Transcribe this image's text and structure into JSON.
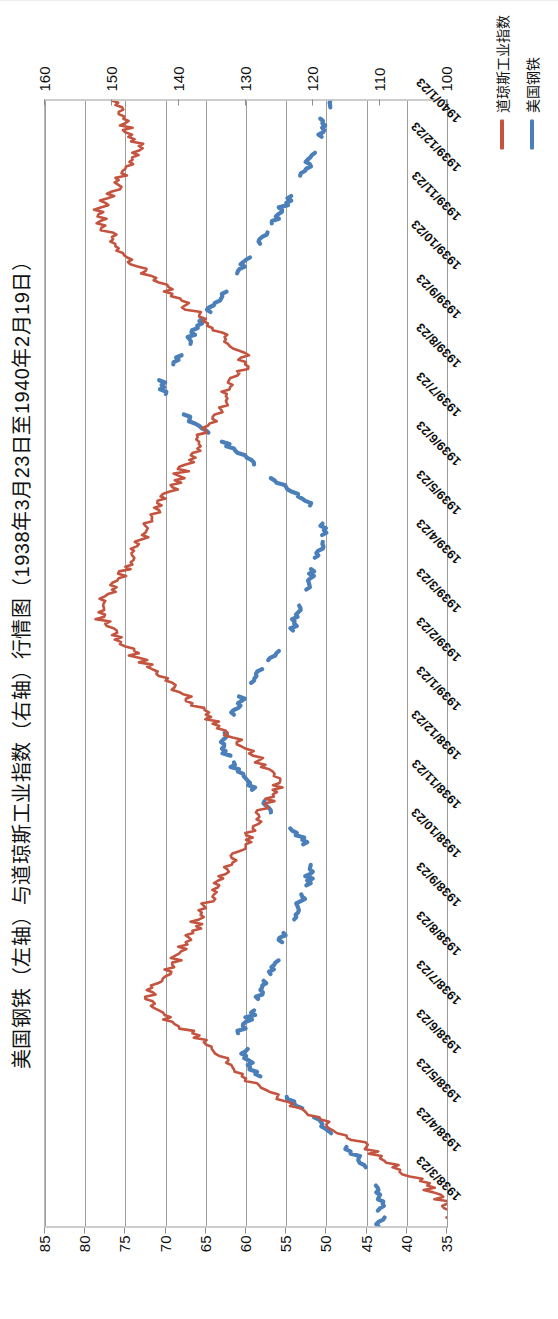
{
  "chart_data": {
    "type": "line",
    "title": "美国钢铁（左轴）与道琼斯工业指数（右轴）行情图（1938年3月23日至1940年2月19日）",
    "xlabel": "",
    "ylabel_left": "美国钢铁",
    "ylabel_right": "道琼斯工业指数",
    "grid": true,
    "legend_position": "bottom-right",
    "axis_left": {
      "name": "美国钢铁（左轴）",
      "ticks": [
        85,
        80,
        75,
        70,
        65,
        60,
        55,
        50,
        45,
        40,
        35
      ],
      "min": 35,
      "max": 85
    },
    "axis_right": {
      "name": "道琼斯工业指数（右轴）",
      "ticks": [
        160,
        150,
        140,
        130,
        120,
        110,
        100
      ],
      "min": 100,
      "max": 160
    },
    "x_tick_labels": [
      "1938/3/23",
      "1938/4/23",
      "1938/5/23",
      "1938/6/23",
      "1938/7/23",
      "1938/8/23",
      "1938/9/23",
      "1938/10/23",
      "1938/11/23",
      "1938/12/23",
      "1939/1/23",
      "1939/2/23",
      "1939/3/23",
      "1939/4/23",
      "1939/5/23",
      "1939/6/23",
      "1939/7/23",
      "1939/8/23",
      "1939/9/23",
      "1939/10/23",
      "1939/11/23",
      "1939/12/23",
      "1940/1/23"
    ],
    "series": [
      {
        "name": "美国钢铁",
        "color": "#4b7fba",
        "axis": "left",
        "note": "蓝色线（左轴，美国钢铁股价，单位美元）",
        "values": [
          43.5,
          43.2,
          43.0,
          43.8,
          44.5,
          45.0,
          46.0,
          47.5,
          49.0,
          50.5,
          52.0,
          54.0,
          56.0,
          58.0,
          59.5,
          60.0,
          60.5,
          61.0,
          60.0,
          59.0,
          58.5,
          58.0,
          57.0,
          56.5,
          56.0,
          55.5,
          55.0,
          54.0,
          53.5,
          53.0,
          52.5,
          52.0,
          51.5,
          52.0,
          53.0,
          54.5,
          56.0,
          57.5,
          58.5,
          59.5,
          61.0,
          62.0,
          63.0,
          62.5,
          62.0,
          61.5,
          61.0,
          60.0,
          59.0,
          58.0,
          57.0,
          56.0,
          55.0,
          54.0,
          53.5,
          53.0,
          52.5,
          52.0,
          51.5,
          51.0,
          50.5,
          50.0,
          50.5,
          51.5,
          53.0,
          55.0,
          57.0,
          59.0,
          61.0,
          63.0,
          65.0,
          67.0,
          69.0,
          70.0,
          70.5,
          70.0,
          69.0,
          68.0,
          67.0,
          66.0,
          65.0,
          64.0,
          63.0,
          62.0,
          61.0,
          60.0,
          59.0,
          58.0,
          57.0,
          56.0,
          55.0,
          54.0,
          53.0,
          52.5,
          52.0,
          51.5,
          51.0,
          50.5,
          50.0,
          49.5
        ]
      },
      {
        "name": "道琼斯工业指数",
        "color": "#c4543f",
        "axis": "right",
        "note": "红色线（右轴，道琼斯工业平均指数）",
        "values": [
          99,
          99,
          100,
          102,
          104,
          107,
          110,
          112,
          115,
          118,
          121,
          124,
          127,
          130,
          132,
          134,
          136,
          138,
          141,
          143,
          145,
          144,
          142,
          141,
          140,
          139,
          138,
          137,
          136,
          135,
          134,
          133,
          132,
          131,
          130,
          129,
          128,
          127,
          126,
          125,
          126,
          128,
          130,
          132,
          134,
          136,
          138,
          140,
          142,
          144,
          146,
          148,
          150,
          151,
          152,
          151,
          150,
          149,
          148,
          147,
          146,
          145,
          144,
          143,
          142,
          141,
          140,
          139,
          138,
          137,
          136,
          135,
          134,
          133,
          132,
          131,
          130,
          131,
          133,
          135,
          137,
          139,
          141,
          143,
          145,
          147,
          149,
          150,
          151,
          152,
          151,
          150,
          149,
          148,
          147,
          146,
          147,
          148,
          149,
          150
        ]
      }
    ]
  },
  "legend": {
    "items": [
      {
        "label": "美国钢铁",
        "color": "#4b7fba"
      },
      {
        "label": "道琼斯工业指数",
        "color": "#c4543f"
      }
    ]
  }
}
